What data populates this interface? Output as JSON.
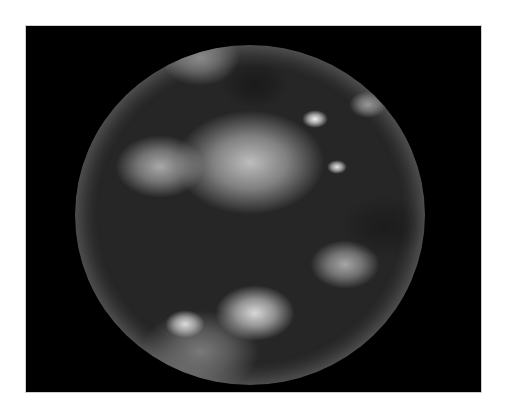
{
  "image": {
    "subject": "Full-disk satellite view of Earth (Western Hemisphere)",
    "rendering": "grayscale",
    "background_color": "#ffffff",
    "frame_color": "#000000"
  },
  "globe": {
    "center": [
      275.5,
      234
    ],
    "radius_x": 175,
    "radius_y": 170,
    "base_color": "#262626",
    "limb_color": "#8c8c8c"
  },
  "features": [
    {
      "name": "hurricane-eye",
      "x": 315,
      "y": 123,
      "size": 26,
      "color": "#f2f2f2"
    },
    {
      "name": "hurricane-swirl",
      "x": 368,
      "y": 110,
      "size": 38,
      "color": "#9a9a9a"
    },
    {
      "name": "bright-convective-cell",
      "x": 337,
      "y": 170,
      "size": 20,
      "color": "#e6e6e6"
    },
    {
      "name": "itcz-cloud-band",
      "x": 250,
      "y": 185,
      "size": 150,
      "color": "#bdbdbd"
    },
    {
      "name": "north-pacific-clouds",
      "x": 160,
      "y": 180,
      "size": 90,
      "color": "#a8a8a8"
    },
    {
      "name": "north-america-land",
      "x": 255,
      "y": 95,
      "size": 70,
      "color": "#1a1a1a"
    },
    {
      "name": "south-america-land",
      "x": 385,
      "y": 240,
      "size": 90,
      "color": "#1c1c1c"
    },
    {
      "name": "south-pacific-cloud-swirl",
      "x": 255,
      "y": 325,
      "size": 80,
      "color": "#d8d8d8"
    },
    {
      "name": "southern-cloud-streak",
      "x": 185,
      "y": 330,
      "size": 40,
      "color": "#dcdcdc"
    },
    {
      "name": "chile-offshore-clouds",
      "x": 345,
      "y": 275,
      "size": 70,
      "color": "#a6a6a6"
    },
    {
      "name": "polar-cloud-band-north",
      "x": 200,
      "y": 70,
      "size": 80,
      "color": "#8a8a8a"
    },
    {
      "name": "polar-cloud-band-south",
      "x": 200,
      "y": 370,
      "size": 120,
      "color": "#7a7a7a"
    }
  ]
}
